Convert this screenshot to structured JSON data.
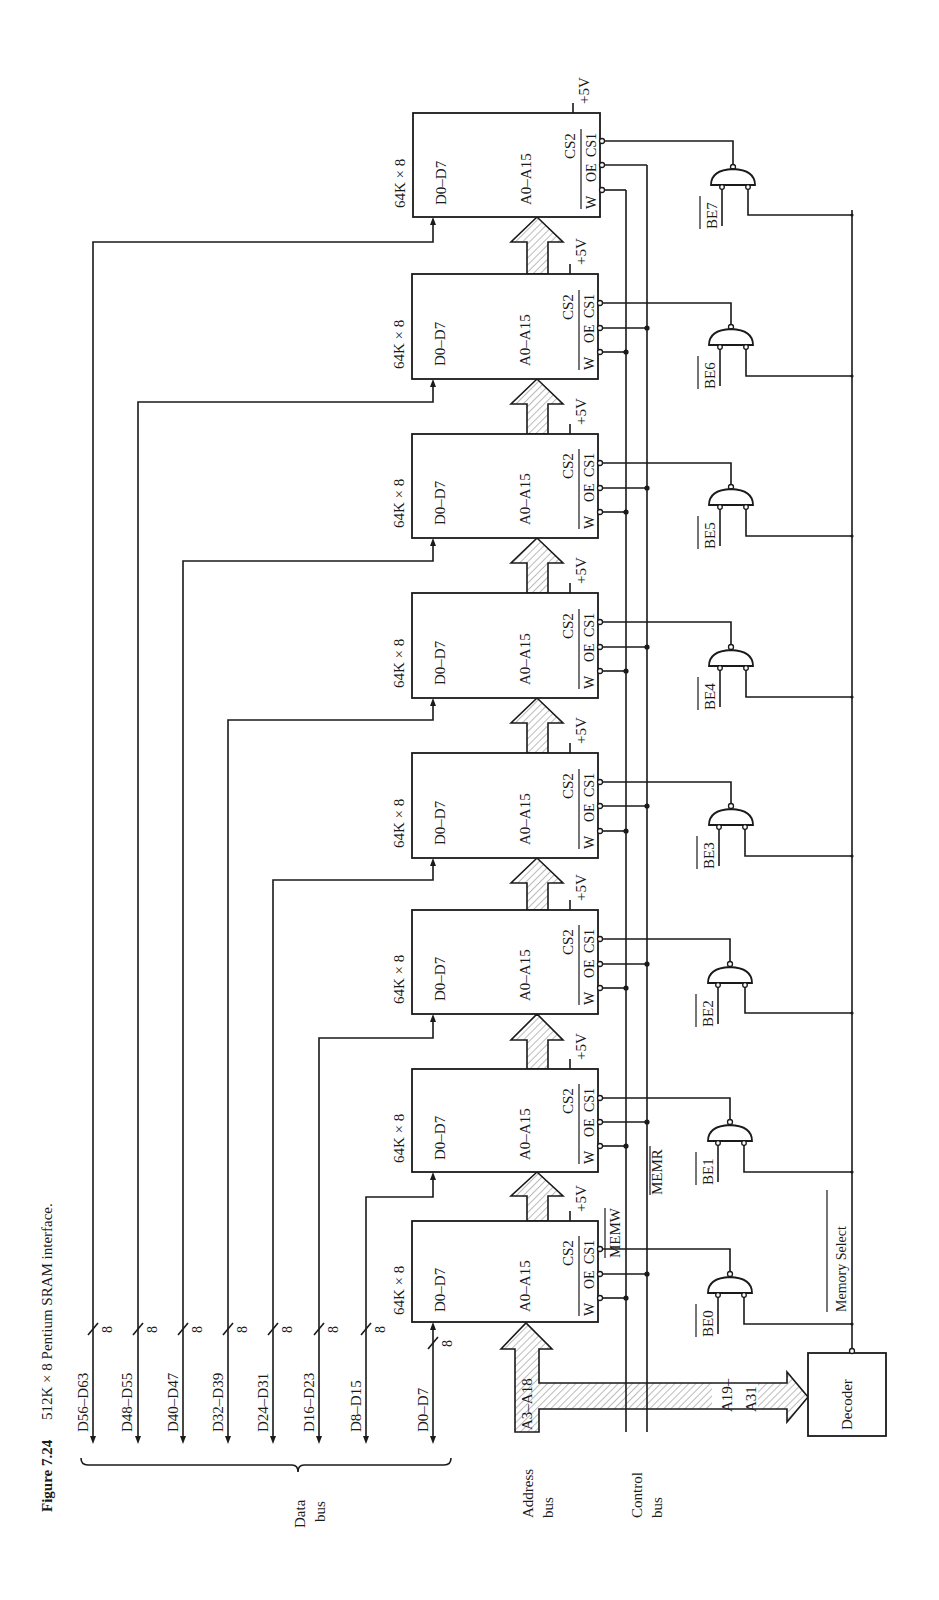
{
  "caption": {
    "figure_number": "Figure 7.24",
    "title": "512K × 8 Pentium SRAM interface."
  },
  "chips": [
    {
      "id": 0,
      "size_label": "64K × 8",
      "data_pins": "D0–D7",
      "addr_pins": "A0–A15",
      "cs2": "CS2",
      "w": "W",
      "oe": "OE",
      "cs1": "CS1",
      "vcc": "+5V"
    },
    {
      "id": 1,
      "size_label": "64K × 8",
      "data_pins": "D0–D7",
      "addr_pins": "A0–A15",
      "cs2": "CS2",
      "w": "W",
      "oe": "OE",
      "cs1": "CS1",
      "vcc": "+5V"
    },
    {
      "id": 2,
      "size_label": "64K × 8",
      "data_pins": "D0–D7",
      "addr_pins": "A0–A15",
      "cs2": "CS2",
      "w": "W",
      "oe": "OE",
      "cs1": "CS1",
      "vcc": "+5V"
    },
    {
      "id": 3,
      "size_label": "64K × 8",
      "data_pins": "D0–D7",
      "addr_pins": "A0–A15",
      "cs2": "CS2",
      "w": "W",
      "oe": "OE",
      "cs1": "CS1",
      "vcc": "+5V"
    },
    {
      "id": 4,
      "size_label": "64K × 8",
      "data_pins": "D0–D7",
      "addr_pins": "A0–A15",
      "cs2": "CS2",
      "w": "W",
      "oe": "OE",
      "cs1": "CS1",
      "vcc": "+5V"
    },
    {
      "id": 5,
      "size_label": "64K × 8",
      "data_pins": "D0–D7",
      "addr_pins": "A0–A15",
      "cs2": "CS2",
      "w": "W",
      "oe": "OE",
      "cs1": "CS1",
      "vcc": "+5V"
    },
    {
      "id": 6,
      "size_label": "64K × 8",
      "data_pins": "D0–D7",
      "addr_pins": "A0–A15",
      "cs2": "CS2",
      "w": "W",
      "oe": "OE",
      "cs1": "CS1",
      "vcc": "+5V"
    },
    {
      "id": 7,
      "size_label": "64K × 8",
      "data_pins": "D0–D7",
      "addr_pins": "A0–A15",
      "cs2": "CS2",
      "w": "W",
      "oe": "OE",
      "cs1": "CS1",
      "vcc": "+5V"
    }
  ],
  "data_bus": {
    "label_line1": "Data",
    "label_line2": "bus",
    "width_label": "8",
    "lines": [
      "D0–D7",
      "D8–D15",
      "D16–D23",
      "D24–D31",
      "D32–D39",
      "D40–D47",
      "D48–D55",
      "D56–D63"
    ]
  },
  "address_bus": {
    "label_line1": "Address",
    "label_line2": "bus",
    "low_label": "A3–A18",
    "high_label_line1": "A19–",
    "high_label_line2": "A31"
  },
  "control_bus": {
    "label_line1": "Control",
    "label_line2": "bus",
    "memw": "MEMW",
    "memr": "MEMR"
  },
  "byte_enables": [
    "BE0",
    "BE1",
    "BE2",
    "BE3",
    "BE4",
    "BE5",
    "BE6",
    "BE7"
  ],
  "decoder": {
    "label": "Decoder",
    "output_label": "Memory Select"
  }
}
